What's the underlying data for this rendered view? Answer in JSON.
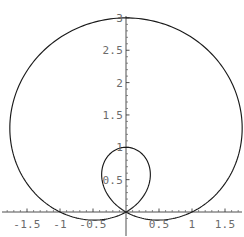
{
  "chart_data": {
    "type": "line",
    "title": "",
    "subtitle": "",
    "xlabel": "",
    "ylabel": "",
    "plot_kind": "polar",
    "curve_equation": "r = 1 + 2 sin(theta)",
    "curve_name": "limacon",
    "grid": false,
    "legend": null,
    "xlim": [
      -1.85,
      1.85
    ],
    "ylim": [
      -0.1,
      3.05
    ],
    "x_ticks": [
      -1.5,
      -1,
      -0.5,
      0.5,
      1,
      1.5
    ],
    "x_tick_labels": [
      "-1.5",
      "-1",
      "-0.5",
      "0.5",
      "1",
      "1.5"
    ],
    "y_ticks": [
      0.5,
      1,
      1.5,
      2,
      2.5,
      3
    ],
    "y_tick_labels": [
      "0.5",
      "1",
      "1.5",
      "2",
      "2.5",
      "3"
    ],
    "x_minor_step": 0.1,
    "y_minor_step": 0.1,
    "annotations": [],
    "features": {
      "outer_loop_top_y": 3,
      "outer_loop_x_extent": [
        -1.76,
        1.76
      ],
      "inner_loop_top_y": 1,
      "inner_loop_x_extent": [
        -0.5,
        0.5
      ],
      "cusp_point": [
        0,
        0
      ]
    },
    "series": [
      {
        "name": "r = 1 + 2 sin(theta)",
        "color": "#1a1a1a",
        "theta_start": 0,
        "theta_end": 6.283185307179586,
        "samples": 400
      }
    ]
  },
  "plot": {
    "origin_px": {
      "x": 126,
      "y": 212
    },
    "scale_px_per_unit": {
      "x": 66,
      "y": 64.7
    },
    "axis_color": "#3a3a3a",
    "tick_color": "#6a6a6a",
    "label_color": "#6b6b6b",
    "curve_color": "#1a1a1a",
    "background_color": "#ffffff"
  }
}
